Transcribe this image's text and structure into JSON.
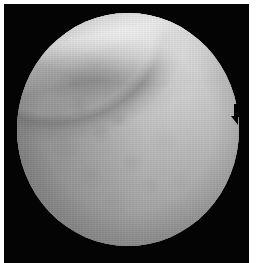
{
  "image": {
    "modality": "endoscopic-video-frame",
    "color_mode": "grayscale",
    "field_of_view_shape": "circular",
    "frame_background_color": "#040404",
    "page_background_color": "#ffffff",
    "alt_text": "Grayscale endoscopic image showing a circular field of view over a black background, with a bright diagonal tissue ridge across the upper portion, a darker shadowed fold beneath it, and mottled vascular mucosal texture filling the lower two thirds."
  },
  "regions": {
    "bright_ridge": {
      "label": "bright tissue ridge",
      "position": "upper band running left to right",
      "tone_hex": "#e8e8e8"
    },
    "dark_fold": {
      "label": "shadowed fold",
      "position": "upper-left of center",
      "tone_hex": "#6e6e6e"
    },
    "mucosa": {
      "label": "mottled mucosal surface",
      "position": "center and lower field",
      "tone_hex": "#a5a5a5"
    },
    "rim_vignette": {
      "label": "peripheral vignette",
      "tone_hex": "#7a7a7a"
    },
    "edge_notch": {
      "label": "optics notch on right rim",
      "position": "right edge, upper-middle",
      "tone_hex": "#040404"
    }
  }
}
